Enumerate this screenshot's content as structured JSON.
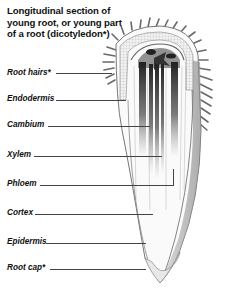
{
  "title": {
    "line1": "Longitudinal section of",
    "line2": "young root, or young part",
    "line3": "of a root (dicotyledon*)"
  },
  "labels": [
    {
      "text": "Root hairs*",
      "y": 73
    },
    {
      "text": "Endodermis",
      "y": 99
    },
    {
      "text": "Cambium",
      "y": 125
    },
    {
      "text": "Xylem",
      "y": 155
    },
    {
      "text": "Phloem",
      "y": 184
    },
    {
      "text": "Cortex",
      "y": 213
    },
    {
      "text": "Epidermis",
      "y": 242
    },
    {
      "text": "Root cap*",
      "y": 268
    }
  ],
  "colors": {
    "text": "#111111",
    "leader": "#444444",
    "vascular_dark": "#222222",
    "tissue_gray": "#9a9a9a",
    "background": "#ffffff"
  }
}
